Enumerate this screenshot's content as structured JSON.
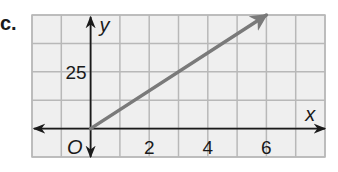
{
  "problem": {
    "label": "c."
  },
  "chart_data": {
    "type": "line",
    "title": "",
    "xlabel": "x",
    "ylabel": "y",
    "origin_label": "O",
    "x_ticks": [
      {
        "value": 2,
        "label": "2"
      },
      {
        "value": 4,
        "label": "4"
      },
      {
        "value": 6,
        "label": "6"
      }
    ],
    "y_ticks": [
      {
        "value": 25,
        "label": "25"
      }
    ],
    "xlim": [
      -2,
      8
    ],
    "ylim": [
      -12.5,
      50
    ],
    "grid": true,
    "x_grid_step": 1,
    "y_grid_step": 12.5,
    "series": [
      {
        "name": "ray",
        "x": [
          0,
          6
        ],
        "y": [
          0,
          50
        ],
        "arrow_end": true,
        "color": "#7a7a7a"
      }
    ]
  },
  "colors": {
    "grid_fill": "#efefef",
    "grid_line": "#b8b8b8",
    "axis": "#1a1a1a",
    "line": "#7a7a7a"
  }
}
